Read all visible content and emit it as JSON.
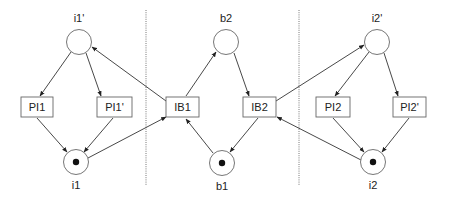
{
  "diagram": {
    "type": "petri-net",
    "places": [
      {
        "id": "i1p",
        "label": "i1'",
        "cx": 79,
        "cy": 42,
        "tokens": 0
      },
      {
        "id": "i1",
        "label": "i1",
        "cx": 76,
        "cy": 162,
        "tokens": 1
      },
      {
        "id": "b2",
        "label": "b2",
        "cx": 226,
        "cy": 42,
        "tokens": 0
      },
      {
        "id": "b1",
        "label": "b1",
        "cx": 222,
        "cy": 163,
        "tokens": 1
      },
      {
        "id": "i2p",
        "label": "i2'",
        "cx": 377,
        "cy": 42,
        "tokens": 0
      },
      {
        "id": "i2",
        "label": "i2",
        "cx": 373,
        "cy": 162,
        "tokens": 1
      }
    ],
    "transitions": [
      {
        "id": "PI1",
        "label": "PI1"
      },
      {
        "id": "PI1p",
        "label": "PI1'"
      },
      {
        "id": "IB1",
        "label": "IB1"
      },
      {
        "id": "IB2",
        "label": "IB2"
      },
      {
        "id": "PI2",
        "label": "PI2"
      },
      {
        "id": "PI2p",
        "label": "PI2'"
      }
    ],
    "arcs": [
      {
        "from": "i1'",
        "to": "PI1"
      },
      {
        "from": "i1'",
        "to": "PI1'"
      },
      {
        "from": "PI1",
        "to": "i1"
      },
      {
        "from": "PI1'",
        "to": "i1"
      },
      {
        "from": "IB1",
        "to": "i1'"
      },
      {
        "from": "i1",
        "to": "IB1"
      },
      {
        "from": "IB1",
        "to": "b2"
      },
      {
        "from": "b2",
        "to": "IB2"
      },
      {
        "from": "IB2",
        "to": "b1"
      },
      {
        "from": "b1",
        "to": "IB1"
      },
      {
        "from": "IB2",
        "to": "i2'"
      },
      {
        "from": "i2",
        "to": "IB2"
      },
      {
        "from": "i2'",
        "to": "PI2"
      },
      {
        "from": "i2'",
        "to": "PI2'"
      },
      {
        "from": "PI2",
        "to": "i2"
      },
      {
        "from": "PI2'",
        "to": "i2"
      }
    ],
    "separators": 2,
    "colors": {
      "stroke": "#333333",
      "box_stroke": "#666666",
      "token": "#111111",
      "background": "#ffffff"
    }
  }
}
